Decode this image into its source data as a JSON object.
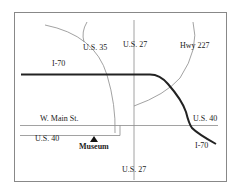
{
  "map": {
    "colors": {
      "background": "#ffffff",
      "border": "#888888",
      "road": "#8a8a8a",
      "interstate": "#222222",
      "text": "#222222"
    },
    "labels": {
      "us35": "U.S. 35",
      "us27_top": "U.S. 27",
      "hwy227": "Hwy 227",
      "i70_left": "I-70",
      "w_main": "W. Main St.",
      "us40_right": "U.S. 40",
      "us40_left": "U.S. 40",
      "museum": "Museum",
      "i70_right": "I-70",
      "us27_bottom": "U.S. 27"
    },
    "landmarks": [
      {
        "name": "Museum",
        "icon": "triangle-marker-icon"
      }
    ]
  }
}
